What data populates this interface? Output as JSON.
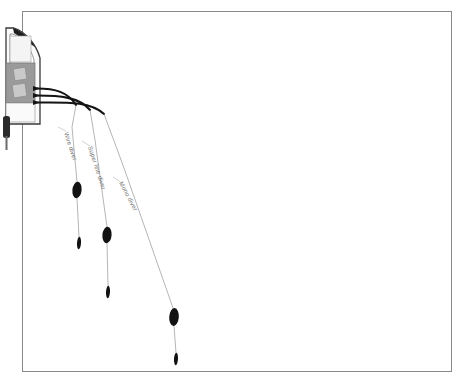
{
  "figure": {
    "background_color": "#ffffff",
    "frame": {
      "stroke_color": "#8a8a8a",
      "x": 22,
      "y": 11,
      "width": 430,
      "height": 361
    }
  },
  "boat": {
    "name": "trolling-boat",
    "hull_fill": "#fbfbfb",
    "hull_stroke": "#3a3a3a",
    "deck_fill": "#9a9a9a",
    "deck_stroke": "#7b7b7b",
    "seat_fill": "#c9c9c9",
    "seat_stroke": "#8c8c8c",
    "motor_fill": "#2b2b2b",
    "gunwale_fill": "#f2f2f2"
  },
  "rods": {
    "stroke_color": "#141414",
    "count": 3,
    "items": [
      {
        "name": "rod-port",
        "label": "rod-1"
      },
      {
        "name": "rod-center",
        "label": "rod-2"
      },
      {
        "name": "rod-starboard",
        "label": "rod-3"
      }
    ]
  },
  "lines": {
    "stroke_color": "#9c9c9c",
    "items": [
      {
        "id": "wire",
        "label": "Wire diver",
        "label_rotation": 72,
        "label_x": 64,
        "label_y": 133,
        "diver": {
          "cx": 77,
          "cy": 190,
          "rx": 4.6,
          "ry": 8.2,
          "fill": "#121212"
        },
        "lure": {
          "cx": 79,
          "cy": 243,
          "rx": 2.0,
          "ry": 6.2,
          "fill": "#121212"
        }
      },
      {
        "id": "superline",
        "label": "Super line diver",
        "label_rotation": 72,
        "label_x": 88,
        "label_y": 147,
        "diver": {
          "cx": 107,
          "cy": 235,
          "rx": 4.6,
          "ry": 8.2,
          "fill": "#121212"
        },
        "lure": {
          "cx": 108,
          "cy": 292,
          "rx": 2.0,
          "ry": 6.2,
          "fill": "#121212"
        }
      },
      {
        "id": "mono",
        "label": "Mono diver",
        "label_rotation": 62,
        "label_x": 119,
        "label_y": 183,
        "diver": {
          "cx": 174,
          "cy": 317,
          "rx": 4.8,
          "ry": 9.0,
          "fill": "#121212"
        },
        "lure": {
          "cx": 176,
          "cy": 359,
          "rx": 2.0,
          "ry": 6.2,
          "fill": "#121212"
        }
      }
    ]
  },
  "caption": {
    "text": ""
  }
}
